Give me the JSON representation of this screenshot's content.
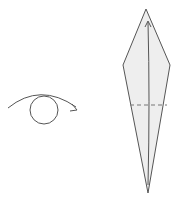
{
  "diagram": {
    "type": "origami-step",
    "colors": {
      "stroke": "#555555",
      "paper_fill": "#eeeeee",
      "background": "#ffffff"
    },
    "symbols": [
      {
        "name": "turn-over-symbol",
        "meaning": "turn model over"
      }
    ],
    "model": {
      "shape": "kite",
      "points": {
        "top": [
          146,
          9
        ],
        "left": [
          123,
          65
        ],
        "right": [
          170,
          65
        ],
        "bottom": [
          148,
          193
        ]
      },
      "fold_line": {
        "style": "dashed",
        "y": 105
      },
      "fold_arrow": {
        "from": [
          148,
          185
        ],
        "to": [
          148,
          22
        ]
      }
    }
  }
}
